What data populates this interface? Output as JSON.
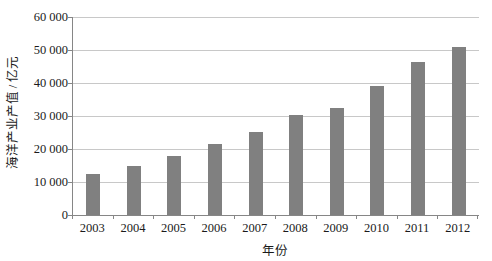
{
  "chart_data": {
    "type": "bar",
    "title": "",
    "subtitle": "",
    "xlabel": "年份",
    "ylabel": "海洋产业产值 / 亿元",
    "categories": [
      "2003",
      "2004",
      "2005",
      "2006",
      "2007",
      "2008",
      "2009",
      "2010",
      "2011",
      "2012"
    ],
    "values": [
      12300,
      15000,
      18000,
      21600,
      25300,
      30200,
      32400,
      39100,
      46300,
      50900
    ],
    "series": [
      {
        "name": "海洋产业产值",
        "values": [
          12300,
          15000,
          18000,
          21600,
          25300,
          30200,
          32400,
          39100,
          46300,
          50900
        ]
      }
    ],
    "ylim": [
      0,
      60000
    ],
    "ytick_values": [
      0,
      10000,
      20000,
      30000,
      40000,
      50000,
      60000
    ],
    "ytick_labels": [
      "0",
      "10 000",
      "20 000",
      "30 000",
      "40 000",
      "50 000",
      "60 000"
    ],
    "grid": true,
    "grid_axis": "y",
    "legend": false,
    "legend_position": "none",
    "bar_color": "#808080",
    "gridline_color": "#c8c8c8",
    "axis_color": "#868686",
    "background_color": "#ffffff",
    "text_color": "#1a1a1a"
  }
}
